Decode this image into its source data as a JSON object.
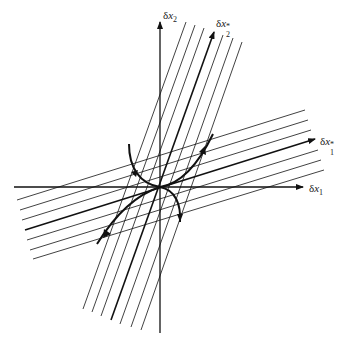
{
  "figure": {
    "labels": {
      "x1_axis": {
        "greek": "δ",
        "var": "x",
        "sub": "1",
        "sup": ""
      },
      "x2_axis": {
        "greek": "δ",
        "var": "x",
        "sub": "2",
        "sup": ""
      },
      "x1_star_axis": {
        "greek": "δ",
        "var": "x",
        "sub": "1",
        "sup": "*"
      },
      "x2_star_axis": {
        "greek": "δ",
        "var": "x",
        "sub": "2",
        "sup": "*"
      }
    },
    "origin": [
      160,
      187
    ],
    "axes": {
      "x1": {
        "from": [
          14,
          187
        ],
        "to": [
          303,
          187
        ]
      },
      "x2": {
        "from": [
          160,
          333
        ],
        "to": [
          160,
          22
        ]
      }
    },
    "shallow_family": [
      {
        "from": [
          17,
          200
        ],
        "to": [
          305,
          110
        ]
      },
      {
        "from": [
          20,
          210
        ],
        "to": [
          308,
          120
        ]
      },
      {
        "from": [
          22,
          220
        ],
        "to": [
          311,
          130
        ]
      },
      {
        "from": [
          25,
          230
        ],
        "to": [
          315,
          139
        ],
        "thick": true,
        "arrow": true
      },
      {
        "from": [
          27,
          240
        ],
        "to": [
          318,
          150
        ]
      },
      {
        "from": [
          30,
          250
        ],
        "to": [
          321,
          160
        ]
      },
      {
        "from": [
          33,
          259
        ],
        "to": [
          324,
          170
        ]
      }
    ],
    "steep_family": [
      {
        "from": [
          83,
          309
        ],
        "to": [
          186,
          22
        ]
      },
      {
        "from": [
          92,
          312
        ],
        "to": [
          195,
          25
        ]
      },
      {
        "from": [
          101,
          316
        ],
        "to": [
          204,
          28
        ]
      },
      {
        "from": [
          111,
          320
        ],
        "to": [
          214,
          32
        ],
        "thick": true,
        "arrow": true
      },
      {
        "from": [
          120,
          324
        ],
        "to": [
          223,
          35
        ]
      },
      {
        "from": [
          131,
          327
        ],
        "to": [
          233,
          38
        ]
      },
      {
        "from": [
          141,
          330
        ],
        "to": [
          242,
          42
        ]
      }
    ],
    "trajectories": [
      {
        "name": "upper-left",
        "path": "M129,144 C129,168 140,184 160,187"
      },
      {
        "name": "lower-right",
        "path": "M160,187 C176,190 181,205 180,222"
      },
      {
        "name": "upper-right",
        "path": "M160,187 C180,184 198,165 213,134"
      },
      {
        "name": "lower-left",
        "path": "M160,187 C135,195 115,215 97,244"
      }
    ]
  }
}
